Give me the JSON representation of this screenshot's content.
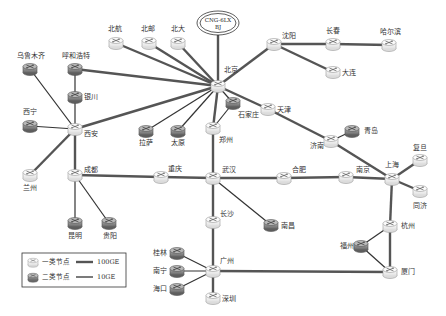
{
  "diagram": {
    "colors": {
      "link_100ge": "#555555",
      "link_10ge": "#333333",
      "type1_fill": "#f4f4f4",
      "type1_stroke": "#9a9a9a",
      "type2_fill": "#8a8a8a",
      "type2_stroke": "#555555",
      "background": "#ffffff"
    },
    "exchange": {
      "id": "cng",
      "line1": "CNG-6LX",
      "line2": "BJ",
      "x": 218,
      "y": 23
    },
    "nodes": [
      {
        "id": "beijing",
        "label": "北京",
        "type": 1,
        "x": 218,
        "y": 86,
        "lx": 224,
        "ly": 72
      },
      {
        "id": "beihang",
        "label": "北航",
        "type": 1,
        "x": 116,
        "y": 43,
        "lx": 108,
        "ly": 31
      },
      {
        "id": "beiyou",
        "label": "北邮",
        "type": 1,
        "x": 149,
        "y": 43,
        "lx": 141,
        "ly": 31
      },
      {
        "id": "beida",
        "label": "北大",
        "type": 1,
        "x": 178,
        "y": 43,
        "lx": 171,
        "ly": 31
      },
      {
        "id": "wulumuqi",
        "label": "乌鲁木齐",
        "type": 2,
        "x": 30,
        "y": 69,
        "lx": 17,
        "ly": 58
      },
      {
        "id": "huhehaote",
        "label": "呼和浩特",
        "type": 2,
        "x": 75,
        "y": 69,
        "lx": 62,
        "ly": 58
      },
      {
        "id": "yinchuan",
        "label": "银川",
        "type": 2,
        "x": 75,
        "y": 97,
        "lx": 84,
        "ly": 99
      },
      {
        "id": "shenyang",
        "label": "沈阳",
        "type": 1,
        "x": 274,
        "y": 44,
        "lx": 282,
        "ly": 38
      },
      {
        "id": "changchun",
        "label": "长春",
        "type": 1,
        "x": 333,
        "y": 44,
        "lx": 326,
        "ly": 33
      },
      {
        "id": "haerbin",
        "label": "哈尔滨",
        "type": 1,
        "x": 389,
        "y": 45,
        "lx": 380,
        "ly": 34
      },
      {
        "id": "dalian",
        "label": "大连",
        "type": 1,
        "x": 333,
        "y": 72,
        "lx": 342,
        "ly": 75
      },
      {
        "id": "xining",
        "label": "西宁",
        "type": 2,
        "x": 30,
        "y": 126,
        "lx": 23,
        "ly": 114
      },
      {
        "id": "xian",
        "label": "西安",
        "type": 1,
        "x": 75,
        "y": 129,
        "lx": 84,
        "ly": 136
      },
      {
        "id": "lanzhou",
        "label": "兰州",
        "type": 1,
        "x": 30,
        "y": 175,
        "lx": 23,
        "ly": 190
      },
      {
        "id": "lasa",
        "label": "拉萨",
        "type": 2,
        "x": 146,
        "y": 131,
        "lx": 139,
        "ly": 145
      },
      {
        "id": "taiyuan",
        "label": "太原",
        "type": 2,
        "x": 178,
        "y": 131,
        "lx": 171,
        "ly": 145
      },
      {
        "id": "shijiazhuang",
        "label": "石家庄",
        "type": 2,
        "x": 233,
        "y": 103,
        "lx": 238,
        "ly": 117
      },
      {
        "id": "zhengzhou",
        "label": "郑州",
        "type": 1,
        "x": 213,
        "y": 128,
        "lx": 219,
        "ly": 142
      },
      {
        "id": "tianjin",
        "label": "天津",
        "type": 1,
        "x": 268,
        "y": 109,
        "lx": 277,
        "ly": 112
      },
      {
        "id": "jinan",
        "label": "济南",
        "type": 1,
        "x": 331,
        "y": 141,
        "lx": 310,
        "ly": 148
      },
      {
        "id": "qingdao",
        "label": "青岛",
        "type": 2,
        "x": 352,
        "y": 131,
        "lx": 364,
        "ly": 133
      },
      {
        "id": "chengdu",
        "label": "成都",
        "type": 1,
        "x": 75,
        "y": 175,
        "lx": 84,
        "ly": 172
      },
      {
        "id": "kunming",
        "label": "昆明",
        "type": 2,
        "x": 75,
        "y": 223,
        "lx": 68,
        "ly": 238
      },
      {
        "id": "guiyang",
        "label": "贵阳",
        "type": 2,
        "x": 109,
        "y": 223,
        "lx": 103,
        "ly": 238
      },
      {
        "id": "chongqing",
        "label": "重庆",
        "type": 1,
        "x": 161,
        "y": 177,
        "lx": 168,
        "ly": 171
      },
      {
        "id": "wuhan",
        "label": "武汉",
        "type": 1,
        "x": 213,
        "y": 178,
        "lx": 222,
        "ly": 172
      },
      {
        "id": "hefei",
        "label": "合肥",
        "type": 1,
        "x": 284,
        "y": 178,
        "lx": 292,
        "ly": 172
      },
      {
        "id": "nanjing",
        "label": "南京",
        "type": 1,
        "x": 346,
        "y": 177,
        "lx": 356,
        "ly": 172
      },
      {
        "id": "shanghai",
        "label": "上海",
        "type": 1,
        "x": 392,
        "y": 179,
        "lx": 385,
        "ly": 167
      },
      {
        "id": "fudan",
        "label": "复旦",
        "type": 1,
        "x": 420,
        "y": 160,
        "lx": 413,
        "ly": 150
      },
      {
        "id": "tongji",
        "label": "同济",
        "type": 1,
        "x": 420,
        "y": 191,
        "lx": 413,
        "ly": 208
      },
      {
        "id": "changsha",
        "label": "长沙",
        "type": 1,
        "x": 213,
        "y": 222,
        "lx": 220,
        "ly": 216
      },
      {
        "id": "nanchang",
        "label": "南昌",
        "type": 2,
        "x": 271,
        "y": 225,
        "lx": 281,
        "ly": 228
      },
      {
        "id": "guangzhou",
        "label": "广州",
        "type": 1,
        "x": 213,
        "y": 271,
        "lx": 220,
        "ly": 263
      },
      {
        "id": "guilin",
        "label": "桂林",
        "type": 2,
        "x": 177,
        "y": 253,
        "lx": 153,
        "ly": 255
      },
      {
        "id": "nanning",
        "label": "南宁",
        "type": 2,
        "x": 177,
        "y": 271,
        "lx": 153,
        "ly": 273
      },
      {
        "id": "haikou",
        "label": "海口",
        "type": 2,
        "x": 177,
        "y": 289,
        "lx": 153,
        "ly": 291
      },
      {
        "id": "shenzhen",
        "label": "深圳",
        "type": 1,
        "x": 213,
        "y": 298,
        "lx": 222,
        "ly": 301
      },
      {
        "id": "hangzhou",
        "label": "杭州",
        "type": 1,
        "x": 390,
        "y": 226,
        "lx": 401,
        "ly": 228
      },
      {
        "id": "fuzhou",
        "label": "福州",
        "type": 2,
        "x": 361,
        "y": 246,
        "lx": 340,
        "ly": 248
      },
      {
        "id": "xiamen",
        "label": "厦门",
        "type": 1,
        "x": 390,
        "y": 272,
        "lx": 401,
        "ly": 274
      }
    ],
    "links": [
      {
        "from": "cng",
        "to": "beijing",
        "speed": "100GE"
      },
      {
        "from": "beijing",
        "to": "beihang",
        "speed": "100GE"
      },
      {
        "from": "beijing",
        "to": "beiyou",
        "speed": "100GE"
      },
      {
        "from": "beijing",
        "to": "beida",
        "speed": "100GE"
      },
      {
        "from": "beijing",
        "to": "huhehaote",
        "speed": "100GE"
      },
      {
        "from": "beijing",
        "to": "xian",
        "speed": "100GE"
      },
      {
        "from": "beijing",
        "to": "lasa",
        "speed": "10GE"
      },
      {
        "from": "beijing",
        "to": "taiyuan",
        "speed": "10GE"
      },
      {
        "from": "beijing",
        "to": "shijiazhuang",
        "speed": "10GE"
      },
      {
        "from": "beijing",
        "to": "zhengzhou",
        "speed": "100GE"
      },
      {
        "from": "beijing",
        "to": "tianjin",
        "speed": "100GE"
      },
      {
        "from": "beijing",
        "to": "shenyang",
        "speed": "100GE"
      },
      {
        "from": "shenyang",
        "to": "changchun",
        "speed": "100GE"
      },
      {
        "from": "changchun",
        "to": "haerbin",
        "speed": "100GE"
      },
      {
        "from": "shenyang",
        "to": "dalian",
        "speed": "100GE"
      },
      {
        "from": "huhehaote",
        "to": "yinchuan",
        "speed": "10GE"
      },
      {
        "from": "yinchuan",
        "to": "xian",
        "speed": "10GE"
      },
      {
        "from": "wulumuqi",
        "to": "xian",
        "speed": "10GE"
      },
      {
        "from": "xining",
        "to": "xian",
        "speed": "10GE"
      },
      {
        "from": "lanzhou",
        "to": "xian",
        "speed": "100GE"
      },
      {
        "from": "xian",
        "to": "chengdu",
        "speed": "100GE"
      },
      {
        "from": "chengdu",
        "to": "kunming",
        "speed": "10GE"
      },
      {
        "from": "chengdu",
        "to": "guiyang",
        "speed": "10GE"
      },
      {
        "from": "chengdu",
        "to": "chongqing",
        "speed": "100GE"
      },
      {
        "from": "chongqing",
        "to": "wuhan",
        "speed": "100GE"
      },
      {
        "from": "zhengzhou",
        "to": "wuhan",
        "speed": "100GE"
      },
      {
        "from": "shijiazhuang",
        "to": "zhengzhou",
        "speed": "10GE"
      },
      {
        "from": "wuhan",
        "to": "hefei",
        "speed": "100GE"
      },
      {
        "from": "hefei",
        "to": "nanjing",
        "speed": "100GE"
      },
      {
        "from": "nanjing",
        "to": "shanghai",
        "speed": "100GE"
      },
      {
        "from": "wuhan",
        "to": "nanchang",
        "speed": "10GE"
      },
      {
        "from": "wuhan",
        "to": "changsha",
        "speed": "100GE"
      },
      {
        "from": "changsha",
        "to": "guangzhou",
        "speed": "100GE"
      },
      {
        "from": "tianjin",
        "to": "jinan",
        "speed": "100GE"
      },
      {
        "from": "jinan",
        "to": "qingdao",
        "speed": "10GE"
      },
      {
        "from": "jinan",
        "to": "shanghai",
        "speed": "100GE"
      },
      {
        "from": "shanghai",
        "to": "fudan",
        "speed": "100GE"
      },
      {
        "from": "shanghai",
        "to": "tongji",
        "speed": "100GE"
      },
      {
        "from": "shanghai",
        "to": "hangzhou",
        "speed": "100GE"
      },
      {
        "from": "hangzhou",
        "to": "fuzhou",
        "speed": "10GE"
      },
      {
        "from": "fuzhou",
        "to": "xiamen",
        "speed": "10GE"
      },
      {
        "from": "hangzhou",
        "to": "xiamen",
        "speed": "100GE"
      },
      {
        "from": "guangzhou",
        "to": "xiamen",
        "speed": "100GE"
      },
      {
        "from": "guangzhou",
        "to": "guilin",
        "speed": "10GE"
      },
      {
        "from": "guangzhou",
        "to": "nanning",
        "speed": "10GE"
      },
      {
        "from": "guangzhou",
        "to": "haikou",
        "speed": "10GE"
      },
      {
        "from": "guangzhou",
        "to": "shenzhen",
        "speed": "100GE"
      }
    ],
    "legend": {
      "type1_label": "一类节点",
      "type2_label": "二类节点",
      "link_100ge_label": "100GE",
      "link_10ge_label": "10GE"
    }
  }
}
